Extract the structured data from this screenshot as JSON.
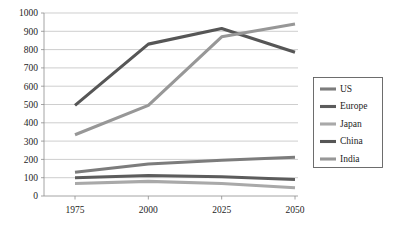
{
  "chart_data": {
    "type": "line",
    "title": "",
    "subtitle": "",
    "xlabel": "",
    "ylabel": "",
    "categories": [
      "1975",
      "2000",
      "2025",
      "2050"
    ],
    "x": [
      1975,
      2000,
      2025,
      2050
    ],
    "xlim": [
      1975,
      2050
    ],
    "ylim": [
      0,
      1000
    ],
    "yticks": [
      0,
      100,
      200,
      300,
      400,
      500,
      600,
      700,
      800,
      900,
      1000
    ],
    "ytick_labels": [
      "0",
      "100",
      "200",
      "300",
      "400",
      "500",
      "600",
      "700",
      "800",
      "900",
      "1000"
    ],
    "xtick_labels": [
      "1975",
      "2000",
      "2025",
      "2050"
    ],
    "grid": "horizontal",
    "legend_position": "right",
    "series": [
      {
        "name": "US",
        "values": [
          130,
          175,
          195,
          212
        ],
        "color": "#7c7c7c"
      },
      {
        "name": "Europe",
        "values": [
          100,
          112,
          105,
          90
        ],
        "color": "#5c5c5c"
      },
      {
        "name": "Japan",
        "values": [
          68,
          80,
          68,
          45
        ],
        "color": "#a9a9a9"
      },
      {
        "name": "China",
        "values": [
          495,
          830,
          915,
          785
        ],
        "color": "#565656"
      },
      {
        "name": "India",
        "values": [
          335,
          495,
          870,
          940
        ],
        "color": "#979797"
      }
    ]
  },
  "legend": {
    "entries": [
      "US",
      "Europe",
      "Japan",
      "China",
      "India"
    ]
  },
  "colors": {
    "background": "#ffffff",
    "gridline": "#b9b9b9",
    "axis": "#8d8d8d",
    "text": "#1d1d1d",
    "legend_border": "#5e5e5e"
  }
}
